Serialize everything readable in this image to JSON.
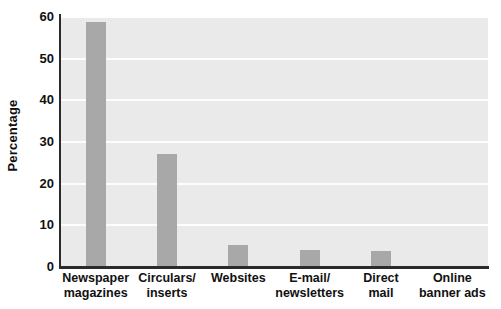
{
  "chart_data": {
    "type": "bar",
    "title": "",
    "subtitle": "",
    "xlabel": "",
    "ylabel": "Percentage",
    "ylim": [
      0,
      60
    ],
    "yticks": [
      0,
      10,
      20,
      30,
      40,
      50,
      60
    ],
    "ytick_labels": [
      "0",
      "10",
      "20",
      "30",
      "40",
      "50",
      "60"
    ],
    "grid": true,
    "legend": null,
    "categories": [
      "Newspaper magazines",
      "Circulars/ inserts",
      "Websites",
      "E-mail/ newsletters",
      "Direct mail",
      "Online banner ads"
    ],
    "category_lines": [
      [
        "Newspaper",
        "magazines"
      ],
      [
        "Circulars/",
        "inserts"
      ],
      [
        "Websites",
        ""
      ],
      [
        "E-mail/",
        "newsletters"
      ],
      [
        "Direct",
        "mail"
      ],
      [
        "Online",
        "banner ads"
      ]
    ],
    "values": [
      58.5,
      26.8,
      5.0,
      3.9,
      3.5,
      0
    ],
    "bar_color": "#a8a8a8",
    "plot_background": "#eaeaea",
    "gridline_color": "#fdfdfd",
    "axis_color": "#2b2b2b",
    "page_background": "#ffffff"
  }
}
